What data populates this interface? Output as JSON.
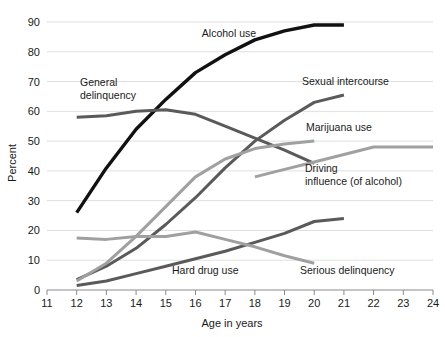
{
  "chart_data": {
    "type": "line",
    "title": "",
    "xlabel": "Age in years",
    "ylabel": "Percent",
    "xlim": [
      11,
      24
    ],
    "ylim": [
      0,
      90
    ],
    "xticks": [
      "11",
      "12",
      "13",
      "14",
      "15",
      "16",
      "17",
      "18",
      "19",
      "20",
      "21",
      "22",
      "23",
      "24"
    ],
    "yticks": [
      "0",
      "10",
      "20",
      "30",
      "40",
      "50",
      "60",
      "70",
      "80",
      "90"
    ],
    "grid": "horizontal",
    "legend": "inline-annotations",
    "series": [
      {
        "name": "Alcohol use",
        "color": "#111111",
        "width": 3.4,
        "label_x": 229,
        "label_y": 37,
        "label_anchor": "middle",
        "x": [
          12,
          13,
          14,
          15,
          16,
          17,
          18,
          19,
          20,
          21
        ],
        "values": [
          26,
          41,
          54,
          64,
          73,
          79,
          84,
          87,
          89,
          89
        ]
      },
      {
        "name": "General delinquency",
        "color": "#5a5a5a",
        "width": 3.0,
        "label_x": 80,
        "label_y": 86,
        "label_anchor": "start",
        "label_line2": "delinquency",
        "x": [
          12,
          13,
          14,
          15,
          16,
          17,
          18,
          19,
          20
        ],
        "values": [
          58,
          58.5,
          60,
          60.5,
          59,
          55,
          51,
          47,
          42.5
        ]
      },
      {
        "name": "Sexual intercourse",
        "color": "#5a5a5a",
        "width": 3.0,
        "label_x": 302,
        "label_y": 85,
        "label_anchor": "start",
        "x": [
          12,
          13,
          14,
          15,
          16,
          17,
          18,
          19,
          20,
          21
        ],
        "values": [
          3.5,
          8,
          14,
          22,
          31,
          41,
          50,
          57,
          63,
          65.5
        ]
      },
      {
        "name": "Marijuana use",
        "color": "#a0a0a0",
        "width": 3.0,
        "label_x": 306,
        "label_y": 131,
        "label_anchor": "start",
        "x": [
          12,
          13,
          14,
          15,
          16,
          17,
          18,
          19,
          20
        ],
        "values": [
          3,
          9,
          18,
          28,
          38,
          44,
          47.5,
          49,
          50
        ]
      },
      {
        "name": "Driving under the influence (of alcohol)",
        "color": "#a0a0a0",
        "width": 3.0,
        "label_x": 305,
        "label_y": 172,
        "label_anchor": "start",
        "label_line2": "influence (of alcohol)",
        "x": [
          18,
          19,
          20,
          21,
          22,
          23,
          24
        ],
        "values": [
          38,
          40.5,
          43,
          45.5,
          48,
          48,
          48
        ]
      },
      {
        "name": "Hard drug use",
        "color": "#5a5a5a",
        "width": 3.0,
        "label_x": 172,
        "label_y": 274,
        "label_anchor": "start",
        "x": [
          12,
          13,
          14,
          15,
          16,
          17,
          18,
          19,
          20,
          21
        ],
        "values": [
          1.5,
          3,
          5.5,
          8,
          10.5,
          13,
          16,
          19,
          23,
          24
        ]
      },
      {
        "name": "Serious delinquency",
        "color": "#a0a0a0",
        "width": 3.0,
        "label_x": 300,
        "label_y": 274,
        "label_anchor": "start",
        "x": [
          12,
          13,
          14,
          15,
          16,
          17,
          18,
          19,
          20
        ],
        "values": [
          17.5,
          17,
          18,
          18,
          19.5,
          17,
          14.5,
          11.5,
          9
        ]
      }
    ]
  },
  "axes": {
    "x_title": "Age in years",
    "y_title": "Percent"
  }
}
